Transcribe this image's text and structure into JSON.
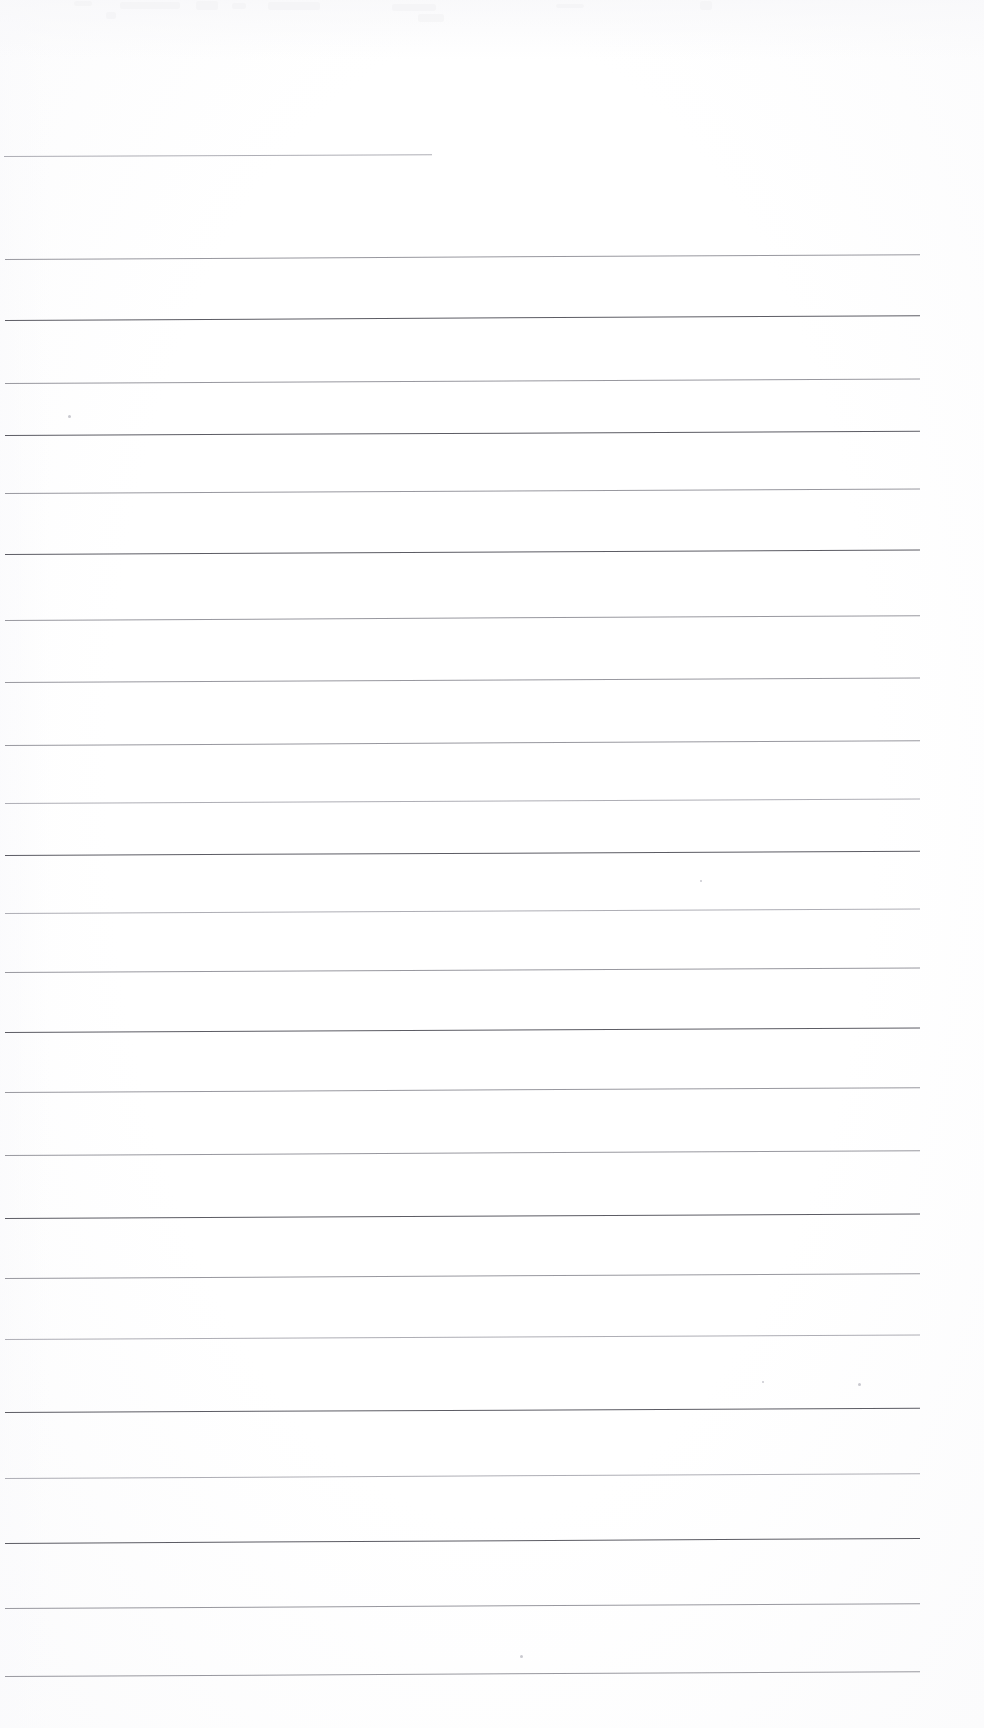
{
  "document": {
    "kind": "scanned-lined-paper",
    "title": "Blank ruled notebook page (scan)",
    "page_width": 984,
    "page_height": 1728,
    "background_color": "#fdfdfd",
    "rule_color": "#6e6e76",
    "content_text": "",
    "visible_text": "none",
    "rule_count": 23,
    "rule_spacing_px": 65
  },
  "rules": [
    {
      "id": "rule-1",
      "y": 156,
      "x": 4,
      "width": 428,
      "tilt_deg": -0.25,
      "weight": "faint"
    },
    {
      "id": "rule-2",
      "y": 259,
      "x": 5,
      "width": 915,
      "tilt_deg": -0.3,
      "weight": "light"
    },
    {
      "id": "rule-3",
      "y": 320,
      "x": 5,
      "width": 915,
      "tilt_deg": -0.3,
      "weight": "dark"
    },
    {
      "id": "rule-4",
      "y": 383,
      "x": 5,
      "width": 915,
      "tilt_deg": -0.28,
      "weight": "light"
    },
    {
      "id": "rule-5",
      "y": 435,
      "x": 5,
      "width": 915,
      "tilt_deg": -0.26,
      "weight": "dark"
    },
    {
      "id": "rule-6",
      "y": 493,
      "x": 5,
      "width": 915,
      "tilt_deg": -0.28,
      "weight": "light"
    },
    {
      "id": "rule-7",
      "y": 554,
      "x": 5,
      "width": 915,
      "tilt_deg": -0.28,
      "weight": "dark"
    },
    {
      "id": "rule-8",
      "y": 620,
      "x": 5,
      "width": 915,
      "tilt_deg": -0.3,
      "weight": "light"
    },
    {
      "id": "rule-9",
      "y": 682,
      "x": 5,
      "width": 915,
      "tilt_deg": -0.28,
      "weight": "light"
    },
    {
      "id": "rule-10",
      "y": 745,
      "x": 5,
      "width": 915,
      "tilt_deg": -0.3,
      "weight": "light"
    },
    {
      "id": "rule-11",
      "y": 803,
      "x": 5,
      "width": 915,
      "tilt_deg": -0.28,
      "weight": "faint"
    },
    {
      "id": "rule-12",
      "y": 855,
      "x": 5,
      "width": 915,
      "tilt_deg": -0.26,
      "weight": "dark"
    },
    {
      "id": "rule-13",
      "y": 913,
      "x": 5,
      "width": 915,
      "tilt_deg": -0.28,
      "weight": "faint"
    },
    {
      "id": "rule-14",
      "y": 972,
      "x": 5,
      "width": 915,
      "tilt_deg": -0.28,
      "weight": "light"
    },
    {
      "id": "rule-15",
      "y": 1032,
      "x": 5,
      "width": 915,
      "tilt_deg": -0.28,
      "weight": "dark"
    },
    {
      "id": "rule-16",
      "y": 1092,
      "x": 5,
      "width": 915,
      "tilt_deg": -0.3,
      "weight": "light"
    },
    {
      "id": "rule-17",
      "y": 1155,
      "x": 5,
      "width": 915,
      "tilt_deg": -0.3,
      "weight": "light"
    },
    {
      "id": "rule-18",
      "y": 1218,
      "x": 5,
      "width": 915,
      "tilt_deg": -0.28,
      "weight": "dark"
    },
    {
      "id": "rule-19",
      "y": 1278,
      "x": 5,
      "width": 915,
      "tilt_deg": -0.3,
      "weight": "light"
    },
    {
      "id": "rule-20",
      "y": 1339,
      "x": 5,
      "width": 915,
      "tilt_deg": -0.28,
      "weight": "faint"
    },
    {
      "id": "rule-21",
      "y": 1412,
      "x": 5,
      "width": 915,
      "tilt_deg": -0.26,
      "weight": "dark"
    },
    {
      "id": "rule-22",
      "y": 1478,
      "x": 5,
      "width": 915,
      "tilt_deg": -0.3,
      "weight": "faint"
    },
    {
      "id": "rule-23",
      "y": 1543,
      "x": 5,
      "width": 915,
      "tilt_deg": -0.32,
      "weight": "dark"
    },
    {
      "id": "rule-24",
      "y": 1608,
      "x": 5,
      "width": 915,
      "tilt_deg": -0.3,
      "weight": "light"
    },
    {
      "id": "rule-25",
      "y": 1676,
      "x": 5,
      "width": 915,
      "tilt_deg": -0.3,
      "weight": "light"
    }
  ],
  "smudges": [
    {
      "x": 120,
      "y": 2,
      "w": 60,
      "h": 7
    },
    {
      "x": 196,
      "y": 1,
      "w": 22,
      "h": 9
    },
    {
      "x": 232,
      "y": 3,
      "w": 14,
      "h": 6
    },
    {
      "x": 268,
      "y": 2,
      "w": 52,
      "h": 8
    },
    {
      "x": 392,
      "y": 4,
      "w": 44,
      "h": 7
    },
    {
      "x": 418,
      "y": 14,
      "w": 26,
      "h": 8
    },
    {
      "x": 106,
      "y": 12,
      "w": 10,
      "h": 7
    },
    {
      "x": 556,
      "y": 4,
      "w": 28,
      "h": 4
    },
    {
      "x": 700,
      "y": 1,
      "w": 12,
      "h": 9
    },
    {
      "x": 74,
      "y": 1,
      "w": 18,
      "h": 5
    }
  ],
  "specks": [
    {
      "x": 68,
      "y": 415,
      "d": 3
    },
    {
      "x": 700,
      "y": 880,
      "d": 2
    },
    {
      "x": 858,
      "y": 1383,
      "d": 3
    },
    {
      "x": 520,
      "y": 1655,
      "d": 3
    },
    {
      "x": 762,
      "y": 1381,
      "d": 2
    }
  ]
}
